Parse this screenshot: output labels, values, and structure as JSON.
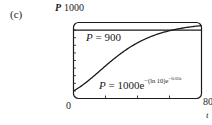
{
  "panel_label": "(c)",
  "chart_data": {
    "type": "line",
    "title": "",
    "xlabel": "t",
    "ylabel": "P",
    "xlim": [
      0,
      80
    ],
    "ylim": [
      0,
      1000
    ],
    "x_ticks_labeled": [
      "0",
      "80"
    ],
    "y_ticks_labeled": [
      "1000"
    ],
    "x_minor_ticks": [
      20,
      40,
      60
    ],
    "y_minor_ticks": [
      100,
      200,
      300,
      400,
      500,
      600,
      700,
      800,
      900
    ],
    "grid": false,
    "frame": "rounded box",
    "series": [
      {
        "name": "P = 1000e^{-(ln 10)e^{-0.05t}}",
        "kind": "curve",
        "formula": "P = 1000*exp(-ln(10)*exp(-0.05*t))",
        "x": [
          0,
          10,
          20,
          30,
          40,
          50,
          60,
          70,
          80
        ],
        "values": [
          100,
          247,
          428,
          598,
          732,
          827,
          891,
          932,
          959
        ]
      },
      {
        "name": "P = 900",
        "kind": "horizontal line",
        "x": [
          0,
          80
        ],
        "values": [
          900,
          900
        ]
      }
    ],
    "annotations": [
      {
        "text": "P = 900",
        "near": "upper-left, below line"
      },
      {
        "text": "P = 1000e^{-(ln 10)e^{-0.05t}}",
        "near": "lower-right inside frame"
      }
    ]
  },
  "labels": {
    "y_axis_symbol": "P",
    "y_top": "1000",
    "x_min": "0",
    "x_max": "80",
    "x_axis_symbol": "t",
    "line_eq_lhs": "P",
    "line_eq_rhs": " = 900",
    "curve_eq_lhs": "P",
    "curve_eq_mid": " = 1000e",
    "curve_eq_exp": "−(ln 10)e",
    "curve_eq_exp2": "−0.05t"
  }
}
